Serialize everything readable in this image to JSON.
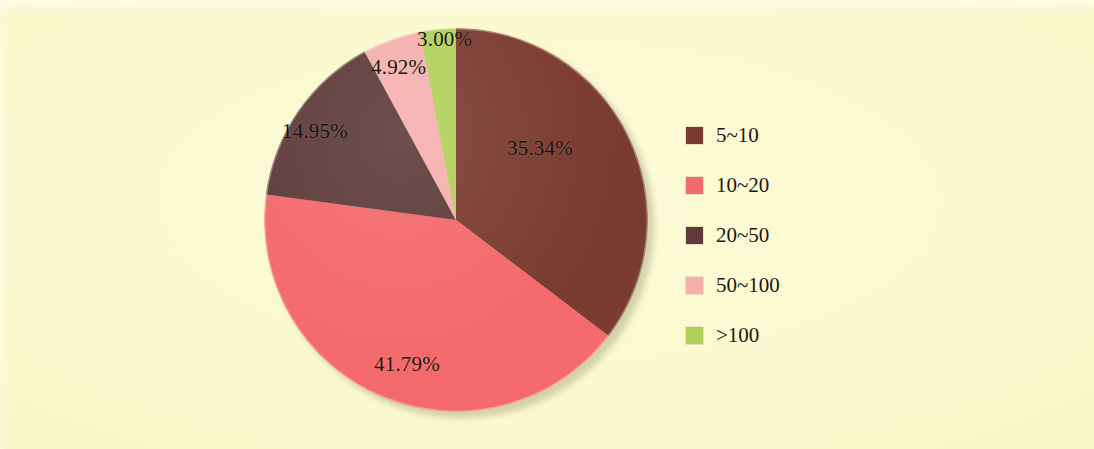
{
  "figure": {
    "background_color": "#fbf9c8",
    "text_color": "#1d1510"
  },
  "chart_data": {
    "type": "pie",
    "title": "",
    "subtitle": "",
    "xlabel": "",
    "ylabel": "",
    "legend_position": "right",
    "grid": false,
    "start_angle_deg": 0,
    "direction": "clockwise",
    "categories": [
      "5~10",
      "10~20",
      "20~50",
      "50~100",
      ">100"
    ],
    "values": [
      35.34,
      41.79,
      14.95,
      4.92,
      3.0
    ],
    "data_labels": [
      "35.34%",
      "41.79%",
      "14.95%",
      "4.92%",
      "3.00%"
    ],
    "colors": [
      "#7a3b30",
      "#f4696b",
      "#5e3b3a",
      "#f5b0ae",
      "#b0d05a"
    ],
    "slices": [
      {
        "label": "5~10",
        "value": 35.34,
        "data_label": "35.34%",
        "color": "#7a3b30"
      },
      {
        "label": "10~20",
        "value": 41.79,
        "data_label": "41.79%",
        "color": "#f4696b"
      },
      {
        "label": "20~50",
        "value": 14.95,
        "data_label": "14.95%",
        "color": "#5e3b3a"
      },
      {
        "label": "50~100",
        "value": 4.92,
        "data_label": "4.92%",
        "color": "#f5b0ae"
      },
      {
        "label": ">100",
        "value": 3.0,
        "data_label": "3.00%",
        "color": "#b0d05a"
      }
    ]
  },
  "legend": {
    "items": [
      {
        "label": "5~10",
        "color": "#7a3b30"
      },
      {
        "label": "10~20",
        "color": "#f4696b"
      },
      {
        "label": "20~50",
        "color": "#5e3b3a"
      },
      {
        "label": "50~100",
        "color": "#f5b0ae"
      },
      {
        "label": ">100",
        "color": "#b0d05a"
      }
    ]
  }
}
